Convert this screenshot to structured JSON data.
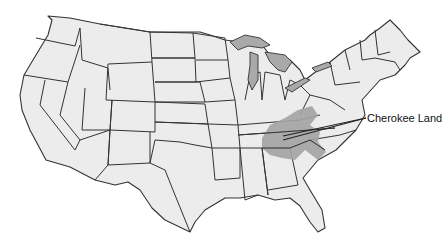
{
  "map": {
    "title": "United States map",
    "highlight": {
      "label": "Cherokee Land",
      "color": "#a3a3a3",
      "region": "Southern Appalachians (Tennessee, Kentucky, North Carolina, Georgia, South Carolina, Alabama)"
    },
    "colors": {
      "state_fill": "#ececec",
      "border": "#333333",
      "lakes": "#a9a9a9",
      "background": "#ffffff"
    }
  }
}
